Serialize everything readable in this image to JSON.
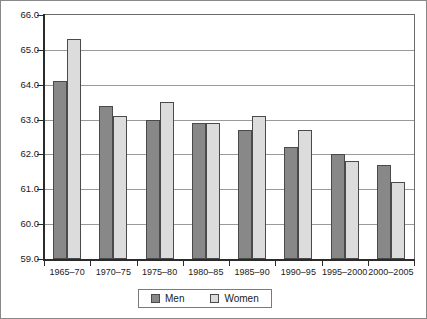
{
  "chart_data": {
    "type": "bar",
    "title": "",
    "subtitle": "",
    "xlabel": "",
    "ylabel": "",
    "ylim": [
      59.0,
      66.0
    ],
    "ytick_step": 1.0,
    "ytick_labels": [
      "66.0",
      "65.0",
      "64.0",
      "63.0",
      "62.0",
      "61.0",
      "60.0",
      "59.0"
    ],
    "ytick_values": [
      66.0,
      65.0,
      64.0,
      63.0,
      62.0,
      61.0,
      60.0,
      59.0
    ],
    "grid": true,
    "grid_axis": "y",
    "legend_position": "bottom-center",
    "categories": [
      "1965–70",
      "1970–75",
      "1975–80",
      "1980–85",
      "1985–90",
      "1990–95",
      "1995–2000",
      "2000–2005"
    ],
    "series": [
      {
        "name": "Men",
        "color": "#888888",
        "values": [
          64.1,
          63.4,
          63.0,
          62.9,
          62.7,
          62.2,
          62.0,
          61.7
        ]
      },
      {
        "name": "Women",
        "color": "#dcdcdc",
        "values": [
          65.3,
          63.1,
          63.5,
          62.9,
          63.1,
          62.7,
          61.8,
          61.2
        ]
      }
    ]
  },
  "legend": {
    "entries": [
      {
        "label": "Men",
        "swatch": "men-swatch"
      },
      {
        "label": "Women",
        "swatch": "women-swatch"
      }
    ]
  }
}
